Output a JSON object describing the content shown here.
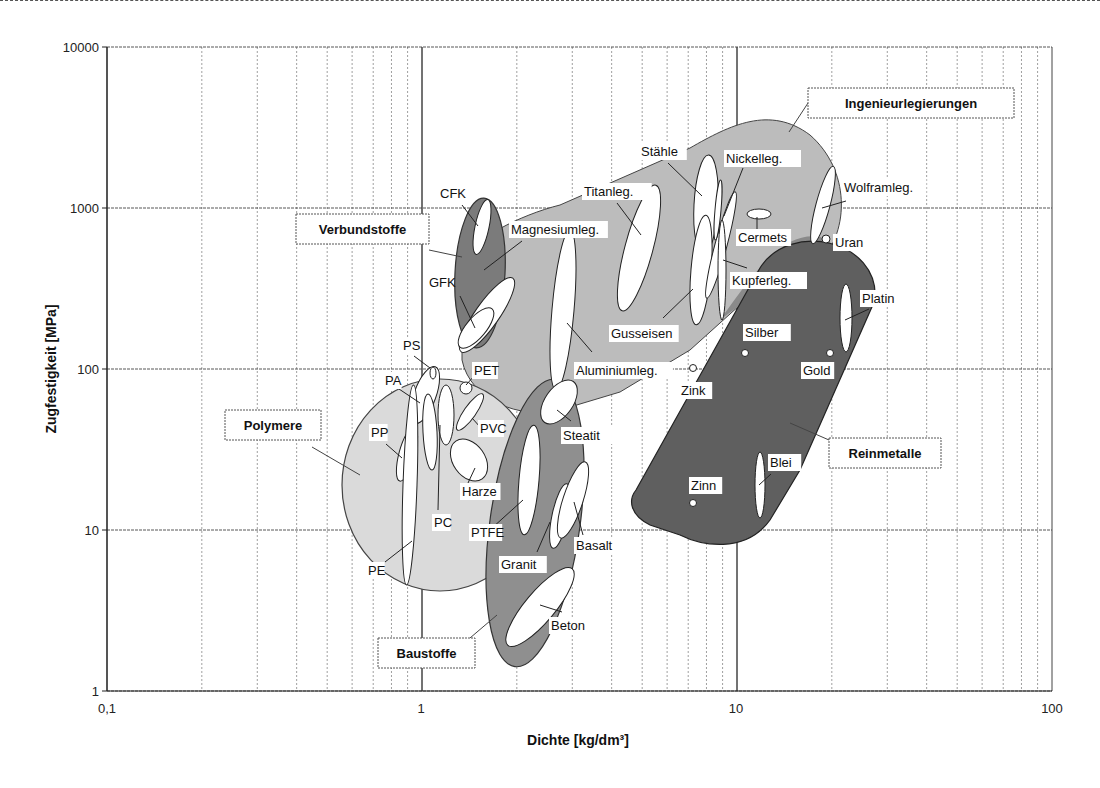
{
  "chart_data": {
    "type": "scatter",
    "subtype": "Ashby material property chart (bubble regions, log-log)",
    "title": "",
    "xlabel": "Dichte [kg/dm³]",
    "ylabel": "Zugfestigkeit [MPa]",
    "xscale": "log",
    "yscale": "log",
    "xlim": [
      0.1,
      100
    ],
    "ylim": [
      1,
      10000
    ],
    "x_ticks": [
      "0,1",
      "1",
      "10",
      "100"
    ],
    "y_ticks": [
      "1",
      "10",
      "100",
      "1000",
      "10000"
    ],
    "grid": true,
    "legend": "none (group labels in boxes)",
    "groups": [
      {
        "name": "Ingenieurlegierungen",
        "density_range": [
          1.7,
          22
        ],
        "strength_range": [
          60,
          3500
        ],
        "shade": "#bdbdbd"
      },
      {
        "name": "Verbundstoffe",
        "density_range": [
          1.3,
          1.9
        ],
        "strength_range": [
          130,
          1100
        ],
        "shade": "#7a7a7a"
      },
      {
        "name": "Polymere",
        "density_range": [
          0.8,
          2.3
        ],
        "strength_range": [
          4,
          90
        ],
        "shade": "#d9d9d9"
      },
      {
        "name": "Baustoffe",
        "density_range": [
          1.9,
          3.2
        ],
        "strength_range": [
          1.6,
          90
        ],
        "shade": "#8c8c8c"
      },
      {
        "name": "Reinmetalle",
        "density_range": [
          5.5,
          26
        ],
        "strength_range": [
          8,
          600
        ],
        "shade": "#5e5e5e"
      }
    ],
    "materials": [
      {
        "name": "CFK",
        "group": "Verbundstoffe",
        "density": [
          1.5,
          1.6
        ],
        "strength": [
          600,
          1000
        ]
      },
      {
        "name": "GFK",
        "group": "Verbundstoffe",
        "density": [
          1.4,
          1.8
        ],
        "strength": [
          140,
          240
        ]
      },
      {
        "name": "Magnesiumleg.",
        "group": "Ingenieurlegierungen",
        "density": [
          1.4,
          1.9
        ],
        "strength": [
          140,
          340
        ]
      },
      {
        "name": "Titanleg.",
        "group": "Ingenieurlegierungen",
        "density": [
          4.4,
          4.8
        ],
        "strength": [
          250,
          1300
        ]
      },
      {
        "name": "Stähle",
        "group": "Ingenieurlegierungen",
        "density": [
          7.6,
          8.1
        ],
        "strength": [
          300,
          2200
        ]
      },
      {
        "name": "Nickelleg.",
        "group": "Ingenieurlegierungen",
        "density": [
          8.3,
          8.9
        ],
        "strength": [
          200,
          1400
        ]
      },
      {
        "name": "Kupferleg.",
        "group": "Ingenieurlegierungen",
        "density": [
          8.4,
          8.9
        ],
        "strength": [
          200,
          1100
        ]
      },
      {
        "name": "Gusseisen",
        "group": "Ingenieurlegierungen",
        "density": [
          7.0,
          7.5
        ],
        "strength": [
          150,
          900
        ]
      },
      {
        "name": "Aluminiumleg.",
        "group": "Ingenieurlegierungen",
        "density": [
          2.6,
          2.9
        ],
        "strength": [
          80,
          560
        ]
      },
      {
        "name": "Cermets",
        "group": "Ingenieurlegierungen",
        "density": [
          11,
          13
        ],
        "strength": [
          900,
          950
        ]
      },
      {
        "name": "Wolframleg.",
        "group": "Ingenieurlegierungen",
        "density": [
          16,
          19
        ],
        "strength": [
          600,
          1800
        ]
      },
      {
        "name": "Uran",
        "group": "Reinmetalle",
        "density": [
          19
        ],
        "strength": [
          650
        ]
      },
      {
        "name": "Platin",
        "group": "Reinmetalle",
        "density": [
          21.4
        ],
        "strength": [
          125,
          480
        ]
      },
      {
        "name": "Silber",
        "group": "Reinmetalle",
        "density": [
          10.5
        ],
        "strength": [
          125
        ]
      },
      {
        "name": "Gold",
        "group": "Reinmetalle",
        "density": [
          19.3
        ],
        "strength": [
          125
        ]
      },
      {
        "name": "Zink",
        "group": "Reinmetalle",
        "density": [
          7.1
        ],
        "strength": [
          100
        ]
      },
      {
        "name": "Zinn",
        "group": "Reinmetalle",
        "density": [
          7.3
        ],
        "strength": [
          15
        ]
      },
      {
        "name": "Blei",
        "group": "Reinmetalle",
        "density": [
          11.3
        ],
        "strength": [
          12,
          30
        ]
      },
      {
        "name": "PS",
        "group": "Polymere",
        "density": [
          1.05
        ],
        "strength": [
          90
        ]
      },
      {
        "name": "PA",
        "group": "Polymere",
        "density": [
          1.0,
          1.2
        ],
        "strength": [
          45,
          100
        ]
      },
      {
        "name": "PET",
        "group": "Polymere",
        "density": [
          1.35
        ],
        "strength": [
          75
        ]
      },
      {
        "name": "PVC",
        "group": "Polymere",
        "density": [
          1.3,
          1.5
        ],
        "strength": [
          40,
          70
        ]
      },
      {
        "name": "PP",
        "group": "Polymere",
        "density": [
          0.89,
          0.92
        ],
        "strength": [
          25,
          45
        ]
      },
      {
        "name": "PC",
        "group": "Polymere",
        "density": [
          1.15,
          1.25
        ],
        "strength": [
          45,
          80
        ]
      },
      {
        "name": "Harze",
        "group": "Polymere",
        "density": [
          1.3,
          1.7
        ],
        "strength": [
          20,
          40
        ]
      },
      {
        "name": "PE",
        "group": "Polymere",
        "density": [
          0.91,
          0.96
        ],
        "strength": [
          5,
          40
        ]
      },
      {
        "name": "PTFE",
        "group": "Baustoffe",
        "density": [
          2.1,
          2.3
        ],
        "strength": [
          12,
          60
        ]
      },
      {
        "name": "Steatit",
        "group": "Baustoffe",
        "density": [
          2.5,
          3.0
        ],
        "strength": [
          50,
          90
        ]
      },
      {
        "name": "Granit",
        "group": "Baustoffe",
        "density": [
          2.5,
          2.7
        ],
        "strength": [
          10,
          22
        ]
      },
      {
        "name": "Basalt",
        "group": "Baustoffe",
        "density": [
          2.7,
          3.0
        ],
        "strength": [
          12,
          30
        ]
      },
      {
        "name": "Beton",
        "group": "Baustoffe",
        "density": [
          2.1,
          2.9
        ],
        "strength": [
          2,
          6
        ]
      }
    ]
  },
  "axes": {
    "xlabel": "Dichte [kg/dm³]",
    "ylabel": "Zugfestigkeit [MPa]",
    "x_ticks": [
      {
        "label": "0,1",
        "px": 107
      },
      {
        "label": "1",
        "px": 421
      },
      {
        "label": "10",
        "px": 736
      },
      {
        "label": "100",
        "px": 1052
      }
    ],
    "y_ticks": [
      {
        "label": "10000",
        "py": 47
      },
      {
        "label": "1000",
        "py": 208
      },
      {
        "label": "100",
        "py": 369
      },
      {
        "label": "10",
        "py": 530
      },
      {
        "label": "1",
        "py": 691
      }
    ]
  },
  "group_labels": [
    {
      "text": "Ingenieurlegierungen",
      "x": 808,
      "y": 88,
      "w": 206,
      "h": 30,
      "lx1": 808,
      "ly1": 103,
      "lx2": 789,
      "ly2": 132
    },
    {
      "text": "Verbundstoffe",
      "x": 296,
      "y": 214,
      "w": 133,
      "h": 30,
      "lx1": 429,
      "ly1": 250,
      "lx2": 462,
      "ly2": 257
    },
    {
      "text": "Polymere",
      "x": 225,
      "y": 410,
      "w": 96,
      "h": 30,
      "lx1": 312,
      "ly1": 447,
      "lx2": 360,
      "ly2": 475
    },
    {
      "text": "Baustoffe",
      "x": 378,
      "y": 638,
      "w": 97,
      "h": 30,
      "lx1": 470,
      "ly1": 638,
      "lx2": 497,
      "ly2": 615
    },
    {
      "text": "Reinmetalle",
      "x": 829,
      "y": 438,
      "w": 112,
      "h": 30,
      "lx1": 829,
      "ly1": 440,
      "lx2": 790,
      "ly2": 423
    }
  ],
  "labels": [
    {
      "text": "CFK",
      "x": 440,
      "y": 198,
      "lx2": 478,
      "ly2": 226,
      "lx1": 462,
      "ly1": 205
    },
    {
      "text": "GFK",
      "x": 429,
      "y": 287,
      "lx1": 460,
      "ly1": 296,
      "lx2": 475,
      "ly2": 328
    },
    {
      "text": "Magnesiumleg.",
      "x": 511,
      "y": 234,
      "lx1": 522,
      "ly1": 241,
      "lx2": 484,
      "ly2": 270
    },
    {
      "text": "Titanleg.",
      "x": 584,
      "y": 196,
      "lx1": 617,
      "ly1": 203,
      "lx2": 641,
      "ly2": 235
    },
    {
      "text": "Stähle",
      "x": 641,
      "y": 156,
      "lx1": 668,
      "ly1": 163,
      "lx2": 702,
      "ly2": 196
    },
    {
      "text": "Nickelleg.",
      "x": 726,
      "y": 163,
      "lx1": 743,
      "ly1": 168,
      "lx2": 724,
      "ly2": 216
    },
    {
      "text": "Cermets",
      "x": 738,
      "y": 242,
      "lx1": 757,
      "ly1": 230,
      "lx2": 757,
      "ly2": 217
    },
    {
      "text": "Uran",
      "x": 835,
      "y": 247,
      "lx1": 0,
      "ly1": 0,
      "lx2": 0,
      "ly2": 0
    },
    {
      "text": "Wolframleg.",
      "x": 844,
      "y": 192,
      "lx1": 846,
      "ly1": 201,
      "lx2": 822,
      "ly2": 208
    },
    {
      "text": "Kupferleg.",
      "x": 732,
      "y": 285,
      "lx1": 747,
      "ly1": 268,
      "lx2": 723,
      "ly2": 260
    },
    {
      "text": "Gusseisen",
      "x": 611,
      "y": 338,
      "lx1": 663,
      "ly1": 318,
      "lx2": 693,
      "ly2": 289
    },
    {
      "text": "Aluminiumleg.",
      "x": 576,
      "y": 375,
      "lx1": 592,
      "ly1": 352,
      "lx2": 567,
      "ly2": 323
    },
    {
      "text": "Zink",
      "x": 681,
      "y": 395,
      "lx1": 0,
      "ly1": 0,
      "lx2": 0,
      "ly2": 0
    },
    {
      "text": "Silber",
      "x": 745,
      "y": 337,
      "lx1": 0,
      "ly1": 0,
      "lx2": 0,
      "ly2": 0
    },
    {
      "text": "Gold",
      "x": 803,
      "y": 375,
      "lx1": 0,
      "ly1": 0,
      "lx2": 0,
      "ly2": 0
    },
    {
      "text": "Platin",
      "x": 862,
      "y": 303,
      "lx1": 869,
      "ly1": 309,
      "lx2": 845,
      "ly2": 320
    },
    {
      "text": "Zinn",
      "x": 691,
      "y": 490,
      "lx1": 0,
      "ly1": 0,
      "lx2": 0,
      "ly2": 0
    },
    {
      "text": "Blei",
      "x": 770,
      "y": 467,
      "lx1": 771,
      "ly1": 474,
      "lx2": 759,
      "ly2": 485
    },
    {
      "text": "PS",
      "x": 403,
      "y": 350,
      "lx1": 414,
      "ly1": 356,
      "lx2": 430,
      "ly2": 368
    },
    {
      "text": "PA",
      "x": 385,
      "y": 385,
      "lx1": 399,
      "ly1": 389,
      "lx2": 420,
      "ly2": 403
    },
    {
      "text": "PET",
      "x": 474,
      "y": 375,
      "lx1": 475,
      "ly1": 375,
      "lx2": 466,
      "ly2": 385
    },
    {
      "text": "PVC",
      "x": 480,
      "y": 433,
      "lx1": 481,
      "ly1": 428,
      "lx2": 472,
      "ly2": 418
    },
    {
      "text": "PP",
      "x": 371,
      "y": 437,
      "lx1": 386,
      "ly1": 444,
      "lx2": 402,
      "ly2": 458
    },
    {
      "text": "Harze",
      "x": 462,
      "y": 496,
      "lx1": 468,
      "ly1": 483,
      "lx2": 475,
      "ly2": 468
    },
    {
      "text": "PC",
      "x": 434,
      "y": 527,
      "lx1": 438,
      "ly1": 510,
      "lx2": 440,
      "ly2": 425
    },
    {
      "text": "PE",
      "x": 368,
      "y": 575,
      "lx1": 385,
      "ly1": 562,
      "lx2": 412,
      "ly2": 541
    },
    {
      "text": "PTFE",
      "x": 471,
      "y": 537,
      "lx1": 492,
      "ly1": 528,
      "lx2": 523,
      "ly2": 500
    },
    {
      "text": "Steatit",
      "x": 563,
      "y": 440,
      "lx1": 571,
      "ly1": 421,
      "lx2": 557,
      "ly2": 410
    },
    {
      "text": "Granit",
      "x": 501,
      "y": 569,
      "lx1": 537,
      "ly1": 552,
      "lx2": 550,
      "ly2": 522
    },
    {
      "text": "Basalt",
      "x": 576,
      "y": 550,
      "lx1": 583,
      "ly1": 535,
      "lx2": 574,
      "ly2": 502
    },
    {
      "text": "Beton",
      "x": 551,
      "y": 630,
      "lx1": 562,
      "ly1": 612,
      "lx2": 540,
      "ly2": 605
    }
  ]
}
